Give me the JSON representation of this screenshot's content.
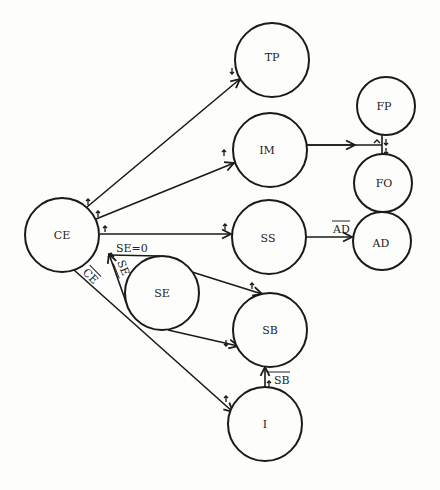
{
  "diagram": {
    "title": "",
    "nodes": [
      {
        "id": "CE",
        "label": "CE",
        "cx": 62,
        "cy": 235,
        "r": 37
      },
      {
        "id": "TP",
        "label": "TP",
        "cx": 272,
        "cy": 60,
        "r": 37
      },
      {
        "id": "IM",
        "label": "IM",
        "cx": 270,
        "cy": 150,
        "r": 37
      },
      {
        "id": "FP",
        "label": "FP",
        "cx": 386,
        "cy": 106,
        "r": 29
      },
      {
        "id": "FO",
        "label": "FO",
        "cx": 383,
        "cy": 183,
        "r": 29
      },
      {
        "id": "SS",
        "label": "SS",
        "cx": 269,
        "cy": 237,
        "r": 37
      },
      {
        "id": "AD",
        "label": "AD",
        "cx": 382,
        "cy": 241,
        "r": 29
      },
      {
        "id": "SE",
        "label": "SE",
        "cx": 162,
        "cy": 293,
        "r": 37
      },
      {
        "id": "SB",
        "label": "SB",
        "cx": 270,
        "cy": 330,
        "r": 37
      },
      {
        "id": "I",
        "label": "I",
        "cx": 265,
        "cy": 424,
        "r": 37
      }
    ],
    "edges": [
      {
        "from": "CE",
        "to": "TP",
        "label": ""
      },
      {
        "from": "CE",
        "to": "IM",
        "label": ""
      },
      {
        "from": "CE",
        "to": "SS",
        "label": ""
      },
      {
        "from": "CE",
        "to": "SE",
        "label": "SE=0"
      },
      {
        "from": "SE",
        "to": "CE",
        "label": "SE",
        "overline": true
      },
      {
        "from": "CE",
        "to": "I",
        "label": "CE",
        "overline": true
      },
      {
        "from": "IM",
        "to": "FP",
        "label": ""
      },
      {
        "from": "FP",
        "to": "FO",
        "label": ""
      },
      {
        "from": "SS",
        "to": "AD",
        "label": "AD",
        "overline": true
      },
      {
        "from": "SE",
        "to": "SB",
        "label": ""
      },
      {
        "from": "SE",
        "to": "SB",
        "label": ""
      },
      {
        "from": "I",
        "to": "SB",
        "label": "SB",
        "overline": true
      }
    ],
    "edge_labels": {
      "se_zero": "SE=0",
      "se_bar": "SE",
      "ce_bar": "CE",
      "ad_bar": "AD",
      "sb_bar": "SB"
    }
  }
}
